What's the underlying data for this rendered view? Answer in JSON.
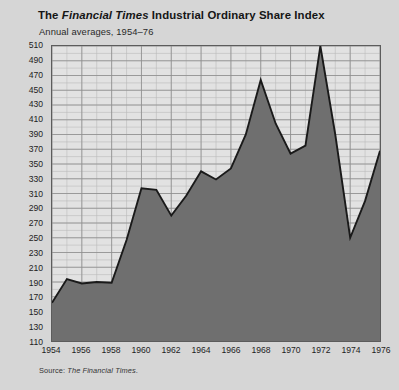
{
  "header": {
    "title_pre": "The ",
    "title_italic": "Financial Times",
    "title_post": " Industrial Ordinary Share Index",
    "title_full": "The Financial Times Industrial Ordinary Share Index",
    "subtitle": "Annual averages, 1954–76"
  },
  "footer": {
    "source_label": "Source: ",
    "source_italic": "The Financial Times",
    "source_end": ".",
    "source_full": "Source: The Financial Times."
  },
  "colors": {
    "page_background": "#d6d6d6",
    "plot_background": "#e2e2e2",
    "area_fill": "#6f6f6f",
    "line": "#1a1a1a",
    "grid_minor": "#b9b9b9",
    "grid_major": "#8d8d8d",
    "frame": "#5c5c5c",
    "text": "#1d1d1d"
  },
  "chart_data": {
    "type": "area",
    "title": "The Financial Times Industrial Ordinary Share Index",
    "subtitle": "Annual averages, 1954–76",
    "xlabel": "",
    "ylabel": "",
    "xlim": [
      1954,
      1976
    ],
    "ylim": [
      110,
      510
    ],
    "y_tick_step": 20,
    "x_tick_step": 2,
    "x_minor_step": 1,
    "y_minor_step": 10,
    "grid": true,
    "legend": "none",
    "source": "Source: The Financial Times.",
    "y_ticks": [
      110,
      130,
      150,
      170,
      190,
      210,
      230,
      250,
      270,
      290,
      310,
      330,
      350,
      370,
      390,
      410,
      430,
      450,
      470,
      490,
      510
    ],
    "x_ticks": [
      1954,
      1956,
      1958,
      1960,
      1962,
      1964,
      1966,
      1968,
      1970,
      1972,
      1974,
      1976
    ],
    "x": [
      1954,
      1955,
      1956,
      1957,
      1958,
      1959,
      1960,
      1961,
      1962,
      1963,
      1964,
      1965,
      1966,
      1967,
      1968,
      1969,
      1970,
      1971,
      1972,
      1973,
      1974,
      1975,
      1976
    ],
    "values": [
      162,
      194,
      188,
      190,
      189,
      247,
      317,
      315,
      280,
      307,
      340,
      329,
      344,
      390,
      464,
      405,
      364,
      375,
      510,
      390,
      250,
      300,
      368
    ],
    "series": [
      {
        "name": "FT Industrial Ordinary Share Index",
        "values": [
          162,
          194,
          188,
          190,
          189,
          247,
          317,
          315,
          280,
          307,
          340,
          329,
          344,
          390,
          464,
          405,
          364,
          375,
          510,
          390,
          250,
          300,
          368
        ]
      }
    ]
  }
}
